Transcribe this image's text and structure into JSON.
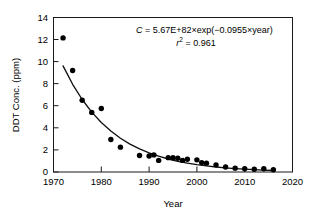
{
  "chart_data": {
    "type": "scatter",
    "title": "",
    "xlabel": "Year",
    "ylabel": "DDT Conc. (ppm)",
    "xlim": [
      1970,
      2020
    ],
    "ylim": [
      0,
      14
    ],
    "xticks": [
      1970,
      1980,
      1990,
      2000,
      2010,
      2020
    ],
    "xtick_labels": [
      "1970",
      "1980",
      "1990",
      "2000",
      "2010",
      "2020"
    ],
    "yticks": [
      0,
      2,
      4,
      6,
      8,
      10,
      12,
      14
    ],
    "ytick_labels": [
      "0",
      "2",
      "4",
      "6",
      "8",
      "10",
      "12",
      "14"
    ],
    "grid": false,
    "legend": null,
    "series": [
      {
        "name": "DDT concentration",
        "marker": "filled-circle",
        "color": "#000000",
        "x": [
          1972,
          1974,
          1976,
          1978,
          1980,
          1982,
          1984,
          1988,
          1990,
          1991,
          1992,
          1994,
          1995,
          1996,
          1997,
          1998,
          2000,
          2001,
          2002,
          2004,
          2006,
          2008,
          2010,
          2012,
          2014,
          2016
        ],
        "y": [
          12.15,
          9.2,
          6.5,
          5.4,
          5.75,
          2.95,
          2.25,
          1.5,
          1.45,
          1.55,
          1.05,
          1.3,
          1.3,
          1.25,
          1.05,
          1.15,
          1.1,
          0.85,
          0.8,
          0.65,
          0.45,
          0.35,
          0.3,
          0.25,
          0.3,
          0.2
        ]
      },
      {
        "name": "exponential fit",
        "type": "line",
        "color": "#111111",
        "x": [
          1972,
          1974,
          1976,
          1978,
          1980,
          1982,
          1984,
          1986,
          1988,
          1990,
          1992,
          1994,
          1996,
          1998,
          2000,
          2002,
          2004,
          2006,
          2008,
          2010,
          2012,
          2014,
          2016
        ],
        "y": [
          9.62,
          7.95,
          6.57,
          5.43,
          4.48,
          3.71,
          3.06,
          2.53,
          2.09,
          1.73,
          1.43,
          1.18,
          0.97,
          0.81,
          0.67,
          0.55,
          0.45,
          0.37,
          0.31,
          0.26,
          0.21,
          0.17,
          0.14
        ]
      }
    ],
    "annotations": [
      {
        "id": "fit-equation",
        "text": "C = 5.67E+82×exp(−0.0955×year)",
        "parts": {
          "variable": "C",
          "equals": " = 5.67E+82×exp(−0.0955×year)"
        }
      },
      {
        "id": "r-squared",
        "text": "r² = 0.961",
        "parts": {
          "variable": "r",
          "superscript": "2",
          "value": " = 0.961"
        }
      }
    ]
  },
  "figure": {
    "background": "#ffffff",
    "frame_color": "#1a1a1a",
    "marker_color": "#000000",
    "curve_color": "#111111"
  }
}
